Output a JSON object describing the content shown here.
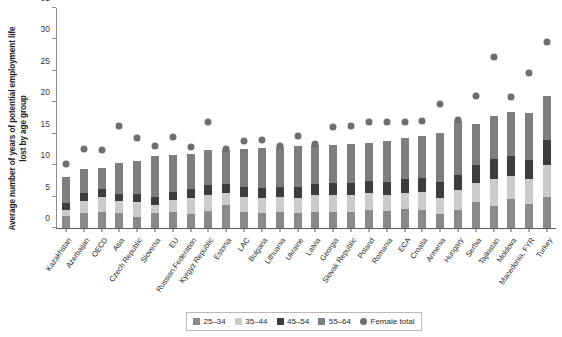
{
  "chart": {
    "type": "bar",
    "title": "",
    "ylabel": "Average number of years of potential employment life lost by age group",
    "xlabel": ""
  },
  "legend": {
    "position": "bottom-center",
    "items": [
      {
        "label": "25–34",
        "color": "#8a8a8a",
        "shape": "square",
        "icon": "legend-swatch-25-34"
      },
      {
        "label": "35–44",
        "color": "#cbcbcb",
        "shape": "square",
        "icon": "legend-swatch-35-44"
      },
      {
        "label": "45–54",
        "color": "#3d3d3d",
        "shape": "square",
        "icon": "legend-swatch-45-54"
      },
      {
        "label": "55–64",
        "color": "#7e7e7e",
        "shape": "square",
        "icon": "legend-swatch-55-64"
      },
      {
        "label": "Female total",
        "color": "#6e6e6e",
        "shape": "circle",
        "icon": "legend-marker-female-total"
      }
    ]
  },
  "chart_data": {
    "type": "bar",
    "stacked": true,
    "title": "",
    "xlabel": "",
    "ylabel": "Average number of years of potential employment life lost by age group",
    "ylim": [
      0,
      35
    ],
    "yticks": [
      0,
      5,
      10,
      15,
      20,
      25,
      30,
      35
    ],
    "grid": false,
    "legend_position": "bottom-center",
    "categories": [
      "Kazakhstan",
      "Azerbaijan",
      "OECD",
      "Asia",
      "Czech Republic",
      "Slovenia",
      "EU",
      "Russian Federation",
      "Kyrgyz Republic",
      "Estonia",
      "LAC",
      "Bulgaria",
      "Lithuania",
      "Ukraine",
      "Latvia",
      "Georgia",
      "Slovak Republic",
      "Poland",
      "Romania",
      "ECA",
      "Croatia",
      "Armenia",
      "Hungary",
      "Serbia",
      "Tajikistan",
      "Moldova",
      "Macedonia, FYR",
      "Turkey"
    ],
    "series": [
      {
        "name": "25–34",
        "color": "#8a8a8a",
        "values": [
          1.9,
          2.4,
          2.5,
          2.4,
          1.8,
          2.4,
          2.5,
          2.2,
          2.7,
          3.6,
          2.6,
          2.4,
          2.5,
          2.4,
          2.6,
          2.6,
          2.6,
          2.8,
          2.7,
          3.0,
          2.8,
          2.3,
          2.9,
          4.1,
          3.5,
          4.6,
          3.8,
          5.0
        ]
      },
      {
        "name": "35–44",
        "color": "#cbcbcb",
        "values": [
          1.0,
          1.9,
          2.4,
          1.9,
          2.3,
          1.2,
          1.9,
          2.5,
          2.5,
          2.0,
          2.4,
          2.4,
          2.4,
          2.4,
          2.6,
          2.7,
          2.6,
          2.7,
          2.6,
          2.6,
          3.0,
          2.4,
          3.2,
          3.0,
          4.3,
          3.6,
          4.0,
          5.0
        ]
      },
      {
        "name": "45–54",
        "color": "#3d3d3d",
        "values": [
          1.1,
          1.2,
          1.3,
          1.1,
          1.3,
          1.4,
          1.3,
          1.5,
          1.6,
          1.4,
          1.6,
          1.6,
          1.6,
          1.7,
          1.8,
          1.9,
          1.9,
          2.0,
          2.1,
          2.2,
          2.2,
          2.6,
          2.4,
          3.0,
          3.2,
          3.3,
          3.1,
          4.0
        ]
      },
      {
        "name": "55–64",
        "color": "#7e7e7e",
        "values": [
          4.1,
          3.9,
          3.4,
          5.0,
          5.2,
          6.5,
          6.0,
          5.5,
          5.6,
          5.4,
          6.0,
          6.3,
          6.4,
          6.6,
          6.2,
          6.0,
          6.3,
          6.1,
          6.5,
          6.5,
          6.6,
          7.8,
          8.5,
          6.4,
          6.8,
          7.0,
          7.4,
          7.0
        ]
      }
    ],
    "overlay_series": {
      "name": "Female total",
      "marker": "circle",
      "color": "#6e6e6e",
      "values": [
        10.2,
        12.6,
        12.4,
        16.3,
        14.3,
        13.1,
        14.5,
        12.9,
        16.8,
        12.5,
        13.8,
        14.0,
        13.1,
        14.7,
        13.3,
        16.0,
        16.2,
        16.8,
        16.9,
        16.9,
        17.0,
        19.8,
        17.2,
        21.0,
        27.2,
        20.9,
        24.6,
        29.6
      ]
    },
    "totals": [
      8.1,
      9.4,
      9.6,
      10.4,
      10.6,
      11.5,
      11.7,
      11.7,
      12.4,
      12.4,
      12.6,
      12.7,
      12.9,
      13.1,
      13.2,
      13.2,
      13.4,
      13.6,
      13.9,
      14.3,
      14.6,
      15.1,
      17.0,
      16.5,
      17.8,
      18.5,
      18.3,
      21.0
    ]
  }
}
